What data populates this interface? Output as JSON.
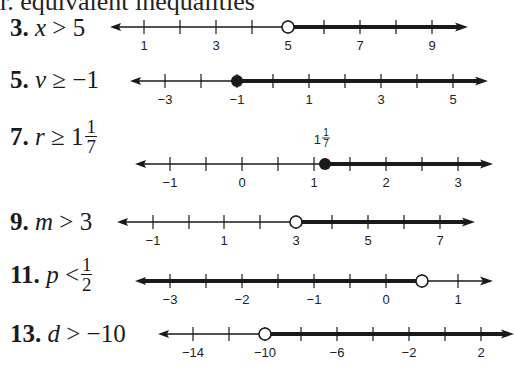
{
  "title": "r. equivalent inequalities",
  "problems": [
    {
      "id": "3",
      "number": "3.",
      "variable": "x",
      "operator": ">",
      "value_whole": "5",
      "value_frac": null,
      "label_top": 14,
      "number_line": {
        "y": 27,
        "x_start": 110,
        "x_end": 468,
        "ticks": [
          {
            "x": 144,
            "value": 1,
            "label": "1"
          },
          {
            "x": 180,
            "value": 2,
            "label": ""
          },
          {
            "x": 216,
            "value": 3,
            "label": "3"
          },
          {
            "x": 252,
            "value": 4,
            "label": ""
          },
          {
            "x": 288,
            "value": 5,
            "label": "5"
          },
          {
            "x": 324,
            "value": 6,
            "label": ""
          },
          {
            "x": 360,
            "value": 7,
            "label": "7"
          },
          {
            "x": 396,
            "value": 8,
            "label": ""
          },
          {
            "x": 432,
            "value": 9,
            "label": "9"
          }
        ],
        "point": {
          "x": 288,
          "value": 5,
          "type": "open"
        },
        "shade": "right",
        "above_label": null
      }
    },
    {
      "id": "5",
      "number": "5.",
      "variable": "v",
      "operator": "≥",
      "value_whole": "−1",
      "value_frac": null,
      "label_top": 66,
      "number_line": {
        "y": 81,
        "x_start": 130,
        "x_end": 488,
        "ticks": [
          {
            "x": 165,
            "value": -3,
            "label": "−3"
          },
          {
            "x": 201,
            "value": -2,
            "label": ""
          },
          {
            "x": 237,
            "value": -1,
            "label": "−1"
          },
          {
            "x": 273,
            "value": 0,
            "label": ""
          },
          {
            "x": 309,
            "value": 1,
            "label": "1"
          },
          {
            "x": 345,
            "value": 2,
            "label": ""
          },
          {
            "x": 381,
            "value": 3,
            "label": "3"
          },
          {
            "x": 417,
            "value": 4,
            "label": ""
          },
          {
            "x": 453,
            "value": 5,
            "label": "5"
          }
        ],
        "point": {
          "x": 237,
          "value": -1,
          "type": "closed"
        },
        "shade": "right",
        "above_label": null
      }
    },
    {
      "id": "7",
      "number": "7.",
      "variable": "r",
      "operator": "≥",
      "value_whole": "1",
      "value_frac": {
        "num": "1",
        "den": "7"
      },
      "label_top": 118,
      "number_line": {
        "y": 164,
        "x_start": 135,
        "x_end": 493,
        "ticks": [
          {
            "x": 170,
            "value": -1,
            "label": "−1"
          },
          {
            "x": 206,
            "value": -0.5,
            "label": ""
          },
          {
            "x": 242,
            "value": 0,
            "label": "0"
          },
          {
            "x": 278,
            "value": 0.5,
            "label": ""
          },
          {
            "x": 314,
            "value": 1,
            "label": "1"
          },
          {
            "x": 350,
            "value": 1.5,
            "label": ""
          },
          {
            "x": 386,
            "value": 2,
            "label": "2"
          },
          {
            "x": 422,
            "value": 2.5,
            "label": ""
          },
          {
            "x": 458,
            "value": 3,
            "label": "3"
          }
        ],
        "point": {
          "x": 325,
          "value": 1.142857,
          "type": "closed"
        },
        "shade": "right",
        "above_label": {
          "whole": "1",
          "num": "1",
          "den": "7",
          "x": 325
        }
      }
    },
    {
      "id": "9",
      "number": "9.",
      "variable": "m",
      "operator": ">",
      "value_whole": "3",
      "value_frac": null,
      "label_top": 208,
      "number_line": {
        "y": 222,
        "x_start": 117,
        "x_end": 475,
        "ticks": [
          {
            "x": 153,
            "value": -1,
            "label": "−1"
          },
          {
            "x": 189,
            "value": 0,
            "label": ""
          },
          {
            "x": 224,
            "value": 1,
            "label": "1"
          },
          {
            "x": 260,
            "value": 2,
            "label": ""
          },
          {
            "x": 296,
            "value": 3,
            "label": "3"
          },
          {
            "x": 332,
            "value": 4,
            "label": ""
          },
          {
            "x": 368,
            "value": 5,
            "label": "5"
          },
          {
            "x": 404,
            "value": 6,
            "label": ""
          },
          {
            "x": 440,
            "value": 7,
            "label": "7"
          }
        ],
        "point": {
          "x": 296,
          "value": 3,
          "type": "open"
        },
        "shade": "right",
        "above_label": null
      }
    },
    {
      "id": "11",
      "number": "11.",
      "variable": "p",
      "operator": "<",
      "value_whole": "",
      "value_frac": {
        "num": "1",
        "den": "2"
      },
      "label_top": 264,
      "number_line": {
        "y": 281,
        "x_start": 135,
        "x_end": 493,
        "ticks": [
          {
            "x": 170,
            "value": -3,
            "label": "−3"
          },
          {
            "x": 206,
            "value": -2.5,
            "label": ""
          },
          {
            "x": 242,
            "value": -2,
            "label": "−2"
          },
          {
            "x": 278,
            "value": -1.5,
            "label": ""
          },
          {
            "x": 314,
            "value": -1,
            "label": "−1"
          },
          {
            "x": 350,
            "value": -0.5,
            "label": ""
          },
          {
            "x": 386,
            "value": 0,
            "label": "0"
          },
          {
            "x": 422,
            "value": 0.5,
            "label": ""
          },
          {
            "x": 458,
            "value": 1,
            "label": "1"
          }
        ],
        "point": {
          "x": 422,
          "value": 0.5,
          "type": "open"
        },
        "shade": "left",
        "above_label": null
      }
    },
    {
      "id": "13",
      "number": "13.",
      "variable": "d",
      "operator": ">",
      "value_whole": "−10",
      "value_frac": null,
      "label_top": 320,
      "number_line": {
        "y": 334,
        "x_start": 158,
        "x_end": 514,
        "ticks": [
          {
            "x": 193,
            "value": -14,
            "label": "−14"
          },
          {
            "x": 229,
            "value": -12,
            "label": ""
          },
          {
            "x": 265,
            "value": -10,
            "label": "−10"
          },
          {
            "x": 301,
            "value": -8,
            "label": ""
          },
          {
            "x": 337,
            "value": -6,
            "label": "−6"
          },
          {
            "x": 373,
            "value": -4,
            "label": ""
          },
          {
            "x": 409,
            "value": -2,
            "label": "−2"
          },
          {
            "x": 445,
            "value": 0,
            "label": ""
          },
          {
            "x": 481,
            "value": 2,
            "label": "2"
          }
        ],
        "point": {
          "x": 265,
          "value": -10,
          "type": "open"
        },
        "shade": "right",
        "above_label": null
      }
    }
  ],
  "colors": {
    "ink": "#1a1a1a",
    "background": "#ffffff"
  }
}
